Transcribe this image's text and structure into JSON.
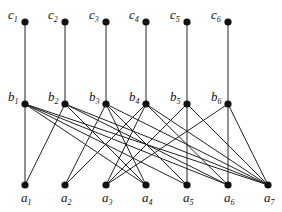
{
  "diagram": {
    "type": "hasse-diagram",
    "levels": {
      "top": [
        {
          "id": "c1",
          "label": "c",
          "sub": "1",
          "x": 25,
          "y": 22
        },
        {
          "id": "c2",
          "label": "c",
          "sub": "2",
          "x": 65,
          "y": 22
        },
        {
          "id": "c3",
          "label": "c",
          "sub": "3",
          "x": 106,
          "y": 22
        },
        {
          "id": "c4",
          "label": "c",
          "sub": "4",
          "x": 146,
          "y": 22
        },
        {
          "id": "c5",
          "label": "c",
          "sub": "5",
          "x": 187,
          "y": 22
        },
        {
          "id": "c6",
          "label": "c",
          "sub": "6",
          "x": 228,
          "y": 22
        }
      ],
      "middle": [
        {
          "id": "b1",
          "label": "b",
          "sub": "1",
          "x": 25,
          "y": 104
        },
        {
          "id": "b2",
          "label": "b",
          "sub": "2",
          "x": 65,
          "y": 104
        },
        {
          "id": "b3",
          "label": "b",
          "sub": "3",
          "x": 106,
          "y": 104
        },
        {
          "id": "b4",
          "label": "b",
          "sub": "4",
          "x": 146,
          "y": 104
        },
        {
          "id": "b5",
          "label": "b",
          "sub": "5",
          "x": 187,
          "y": 104
        },
        {
          "id": "b6",
          "label": "b",
          "sub": "6",
          "x": 228,
          "y": 104
        }
      ],
      "bottom": [
        {
          "id": "a1",
          "label": "a",
          "sub": "1",
          "x": 25,
          "y": 185
        },
        {
          "id": "a2",
          "label": "a",
          "sub": "2",
          "x": 65,
          "y": 185
        },
        {
          "id": "a3",
          "label": "a",
          "sub": "3",
          "x": 106,
          "y": 185
        },
        {
          "id": "a4",
          "label": "a",
          "sub": "4",
          "x": 146,
          "y": 185
        },
        {
          "id": "a5",
          "label": "a",
          "sub": "5",
          "x": 187,
          "y": 185
        },
        {
          "id": "a6",
          "label": "a",
          "sub": "6",
          "x": 228,
          "y": 185
        },
        {
          "id": "a7",
          "label": "a",
          "sub": "7",
          "x": 268,
          "y": 185
        }
      ]
    },
    "edges": [
      [
        "c1",
        "b1"
      ],
      [
        "c2",
        "b2"
      ],
      [
        "c3",
        "b3"
      ],
      [
        "c4",
        "b4"
      ],
      [
        "c5",
        "b5"
      ],
      [
        "c6",
        "b6"
      ],
      [
        "b1",
        "a1"
      ],
      [
        "b1",
        "a4"
      ],
      [
        "b1",
        "a5"
      ],
      [
        "b1",
        "a6"
      ],
      [
        "b1",
        "a7"
      ],
      [
        "b2",
        "a1"
      ],
      [
        "b2",
        "a4"
      ],
      [
        "b2",
        "a6"
      ],
      [
        "b2",
        "a7"
      ],
      [
        "b3",
        "a2"
      ],
      [
        "b3",
        "a4"
      ],
      [
        "b3",
        "a5"
      ],
      [
        "b3",
        "a7"
      ],
      [
        "b4",
        "a2"
      ],
      [
        "b4",
        "a3"
      ],
      [
        "b4",
        "a6"
      ],
      [
        "b4",
        "a7"
      ],
      [
        "b5",
        "a3"
      ],
      [
        "b5",
        "a5"
      ],
      [
        "b5",
        "a7"
      ],
      [
        "b6",
        "a3"
      ],
      [
        "b6",
        "a6"
      ],
      [
        "b6",
        "a7"
      ]
    ],
    "colors": {
      "node": "#111111",
      "edge": "#222222",
      "background": "#ffffff"
    }
  }
}
